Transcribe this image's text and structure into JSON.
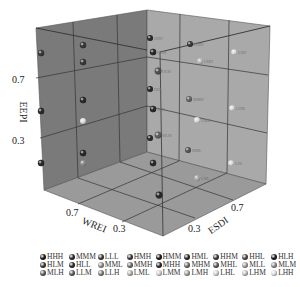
{
  "chart_data": {
    "type": "scatter",
    "subtype": "3d-scatter",
    "title": "",
    "axes": {
      "x": {
        "label": "WREI",
        "ticks": [
          "0.7",
          "0.3"
        ]
      },
      "y": {
        "label": "ESDI",
        "ticks": [
          "0.3",
          "0.7"
        ]
      },
      "z": {
        "label": "EEPI",
        "ticks": [
          "0.3",
          "0.7"
        ]
      }
    },
    "grid": true,
    "legend_position": "bottom",
    "level_values": {
      "L": 0.15,
      "M": 0.5,
      "H": 0.85
    },
    "points_note": "27 classes = combinations of High/Medium/Low across EEPI, WREI, ESDI",
    "legend": [
      [
        "HHH",
        "MMM",
        "LLL",
        "HMH",
        "HMM",
        "HML",
        "HHM",
        "HHL",
        "HLH"
      ],
      [
        "HLM",
        "HLL",
        "MML",
        "MMH",
        "MHH",
        "MHM",
        "MHL",
        "MLL",
        "MLM"
      ],
      [
        "MLH",
        "LLM",
        "LLH",
        "LML",
        "LMM",
        "LMH",
        "LHL",
        "LHM",
        "LHH"
      ]
    ],
    "legend_colors": [
      [
        "#1a1a1a",
        "#2a2a2a",
        "#3a3a3a",
        "#3a3a3a",
        "#1a1a1a",
        "#2a2a2a",
        "#3a3a3a",
        "#4a4a4a",
        "#1a1a1a"
      ],
      [
        "#3a3a3a",
        "#2a2a2a",
        "#8a8a8a",
        "#6a6a6a",
        "#2a2a2a",
        "#6a6a6a",
        "#5a5a5a",
        "#9a9a9a",
        "#8a8a8a"
      ],
      [
        "#5a5a5a",
        "#5a5a5a",
        "#7a7a7a",
        "#aaaaaa",
        "#c8c8c8",
        "#9a9a9a",
        "#cccccc",
        "#bbbbbb",
        "#d8d8d8"
      ]
    ],
    "points": [
      {
        "x": 520,
        "y": 215,
        "c": "#2a2a2a",
        "r": 3.2,
        "label": ""
      },
      {
        "x": 575,
        "y": 190,
        "c": "#2a2a2a",
        "r": 3.2,
        "label": ""
      },
      {
        "x": 575,
        "y": 205,
        "c": "#2a2a2a",
        "r": 3.2,
        "label": ""
      },
      {
        "x": 520,
        "y": 300,
        "c": "#1a1a1a",
        "r": 3.2,
        "label": ""
      },
      {
        "x": 575,
        "y": 285,
        "c": "#1a1a1a",
        "r": 3.2,
        "label": ""
      },
      {
        "x": 575,
        "y": 305,
        "c": "#dddddd",
        "r": 3.0,
        "label": ""
      },
      {
        "x": 520,
        "y": 400,
        "c": "#1a1a1a",
        "r": 3.2,
        "label": ""
      },
      {
        "x": 575,
        "y": 375,
        "c": "#1a1a1a",
        "r": 3.2,
        "label": ""
      },
      {
        "x": 575,
        "y": 400,
        "c": "#8a8a8a",
        "r": 3.0,
        "label": ""
      },
      {
        "x": 150,
        "y": 38,
        "c": "#1a1a1a",
        "r": 3.0,
        "label": "HHH"
      },
      {
        "x": 153,
        "y": 52,
        "c": "#1a1a1a",
        "r": 3.2,
        "label": "HHM"
      },
      {
        "x": 158,
        "y": 71,
        "c": "#444444",
        "r": 3.4,
        "label": "HLM"
      },
      {
        "x": 150,
        "y": 89,
        "c": "#1a1a1a",
        "r": 3.0,
        "label": "HHL"
      },
      {
        "x": 153,
        "y": 109,
        "c": "#1a1a1a",
        "r": 3.2,
        "label": "MHL"
      },
      {
        "x": 158,
        "y": 135,
        "c": "#555555",
        "r": 3.4,
        "label": "MLM"
      },
      {
        "x": 150,
        "y": 138,
        "c": "#1a1a1a",
        "r": 3.0,
        "label": ""
      },
      {
        "x": 153,
        "y": 163,
        "c": "#1a1a1a",
        "r": 3.2,
        "label": ""
      },
      {
        "x": 159,
        "y": 195,
        "c": "#1a1a1a",
        "r": 3.4,
        "label": ""
      },
      {
        "x": 190,
        "y": 44,
        "c": "#2a2a2a",
        "r": 3.0,
        "label": "HMH"
      },
      {
        "x": 200,
        "y": 61,
        "c": "#bbbbbb",
        "r": 3.0,
        "label": "LMH"
      },
      {
        "x": 189,
        "y": 99,
        "c": "#5a5a5a",
        "r": 3.0,
        "label": "MMM"
      },
      {
        "x": 197,
        "y": 120,
        "c": "#dddddd",
        "r": 3.0,
        "label": "LMM"
      },
      {
        "x": 188,
        "y": 150,
        "c": "#4a4a4a",
        "r": 3.0,
        "label": "MML"
      },
      {
        "x": 197,
        "y": 178,
        "c": "#aaaaaa",
        "r": 3.0,
        "label": "LML"
      },
      {
        "x": 234,
        "y": 52,
        "c": "#dddddd",
        "r": 2.8,
        "label": "LHH"
      },
      {
        "x": 232,
        "y": 108,
        "c": "#dddddd",
        "r": 2.8,
        "label": "LHM"
      },
      {
        "x": 231,
        "y": 163,
        "c": "#dddddd",
        "r": 2.8,
        "label": "LHL"
      }
    ]
  }
}
